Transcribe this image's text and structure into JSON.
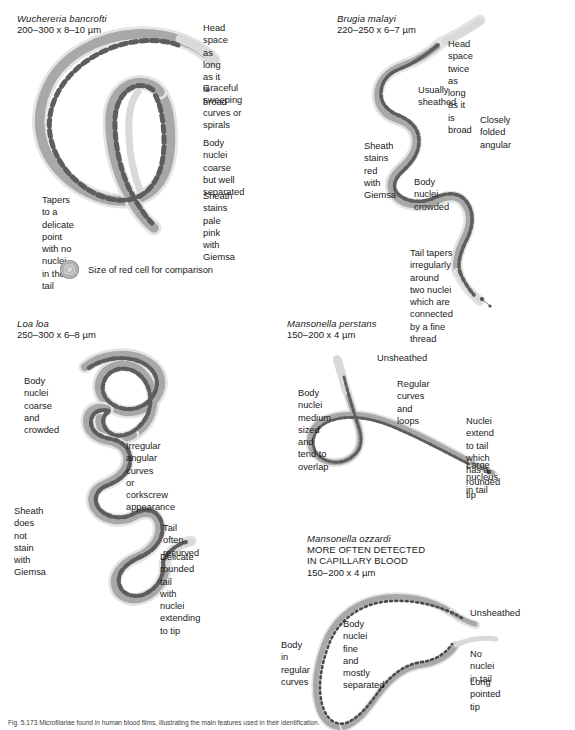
{
  "figure": {
    "caption": "Fig. 5.173  Microfilariae found in human blood films, illustrating the main features used in their identification."
  },
  "legend": {
    "icon": "red-blood-cell-icon",
    "text": "Size of red cell for comparison"
  },
  "panels": [
    {
      "id": "wuchereria-bancrofti",
      "species": "Wuchereria bancrofti",
      "dimensions": "200–300 x 8–10 µm",
      "caps_lines": [],
      "annotations": [
        {
          "name": "head-space",
          "text": "Head space as\nlong as it is broad"
        },
        {
          "name": "curves",
          "text": "Graceful sweeping\ncurves or spirals"
        },
        {
          "name": "body-nuclei",
          "text": "Body nuclei coarse\nbut well separated"
        },
        {
          "name": "sheath-stain",
          "text": "Sheath stains\npale pink with\nGiemsa"
        },
        {
          "name": "tail",
          "text": "Tapers to a\ndelicate point\nwith no nuclei\nin the tail"
        }
      ]
    },
    {
      "id": "brugia-malayi",
      "species": "Brugia malayi",
      "dimensions": "220–250 x 6–7 µm",
      "caps_lines": [],
      "annotations": [
        {
          "name": "head-space",
          "text": "Head space twice\nas long as it is broad"
        },
        {
          "name": "sheathed",
          "text": "Usually sheathed"
        },
        {
          "name": "folded",
          "text": "Closely folded\nangular"
        },
        {
          "name": "sheath-stain",
          "text": "Sheath stains\nred with Giemsa"
        },
        {
          "name": "body-nuclei",
          "text": "Body nuclei\ncrowded"
        },
        {
          "name": "tail",
          "text": "Tail tapers irregularly\naround two nuclei\nwhich are connected\nby a fine thread"
        }
      ]
    },
    {
      "id": "loa-loa",
      "species": "Loa loa",
      "dimensions": "250–300 x 6–8 µm",
      "caps_lines": [],
      "annotations": [
        {
          "name": "body-nuclei",
          "text": "Body nuclei\ncoarse and\ncrowded"
        },
        {
          "name": "curves",
          "text": "Irregular angular curves\nor corkscrew appearance"
        },
        {
          "name": "sheath-stain",
          "text": "Sheath does not\nstain with Giemsa"
        },
        {
          "name": "tail-recurved",
          "text": "Tail often recurved"
        },
        {
          "name": "tail",
          "text": "Delicate\nrounded tail\nwith nuclei\nextending to tip"
        }
      ]
    },
    {
      "id": "mansonella-perstans",
      "species": "Mansonella perstans",
      "dimensions": "150–200 x 4 µm",
      "caps_lines": [],
      "annotations": [
        {
          "name": "unsheathed",
          "text": "Unsheathed"
        },
        {
          "name": "curves",
          "text": "Regular curves and loops"
        },
        {
          "name": "body-nuclei",
          "text": "Body nuclei medium sized\nand tend to overlap"
        },
        {
          "name": "tail-nuclei",
          "text": "Nuclei extend to tail\nwhich has a rounded\ntip"
        },
        {
          "name": "large-nucleus",
          "text": "Large nucleus in tail"
        }
      ]
    },
    {
      "id": "mansonella-ozzardi",
      "species": "Mansonella ozzardi",
      "dimensions": "150–200 x 4 µm",
      "caps_lines": [
        "MORE OFTEN DETECTED",
        "IN CAPILLARY BLOOD"
      ],
      "annotations": [
        {
          "name": "unsheathed",
          "text": "Unsheathed"
        },
        {
          "name": "body-nuclei",
          "text": "Body nuclei fine\nand mostly separated"
        },
        {
          "name": "body-curves",
          "text": "Body in\nregular\ncurves"
        },
        {
          "name": "tail-nuclei",
          "text": "No nuclei in tail"
        },
        {
          "name": "tip",
          "text": "Long pointed tip"
        }
      ]
    }
  ]
}
